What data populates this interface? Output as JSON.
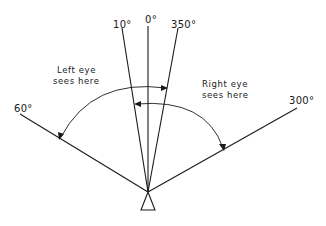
{
  "diagram": {
    "angle_labels": {
      "a10": "10°",
      "a0": "0°",
      "a350": "350°",
      "a60": "60°",
      "a300": "300°"
    },
    "left_eye_note": {
      "line1": "Left eye",
      "line2": "sees here"
    },
    "right_eye_note": {
      "line1": "Right eye",
      "line2": "sees here"
    },
    "rays": [
      {
        "angle_label": "0°",
        "from": [
          148,
          192
        ],
        "to": [
          148,
          26
        ]
      },
      {
        "angle_label": "10°",
        "from": [
          148,
          192
        ],
        "to": [
          122,
          28
        ]
      },
      {
        "angle_label": "350°",
        "from": [
          148,
          192
        ],
        "to": [
          178,
          28
        ]
      },
      {
        "angle_label": "60°",
        "from": [
          148,
          192
        ],
        "to": [
          20,
          114
        ]
      },
      {
        "angle_label": "300°",
        "from": [
          148,
          192
        ],
        "to": [
          297,
          108
        ]
      }
    ],
    "left_eye_field": {
      "from_label": "350°",
      "to_label": "60°"
    },
    "right_eye_field": {
      "from_label": "10°",
      "to_label": "300°"
    },
    "colors": {
      "line": "#1a1a1a",
      "background": "#ffffff"
    }
  }
}
